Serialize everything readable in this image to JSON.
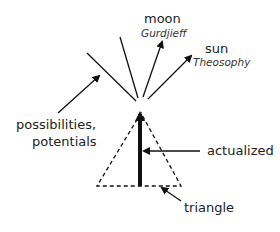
{
  "labels": {
    "moon": "moon",
    "moon_sub": "Gurdjieff",
    "sun": "sun",
    "sun_sub": "Theosophy",
    "possibilities_line1": "possibilities,",
    "possibilities_line2": "potentials",
    "actualized": "actualized",
    "triangle": "triangle"
  },
  "colors": {
    "stroke": "#111111",
    "background": "#ffffff"
  }
}
